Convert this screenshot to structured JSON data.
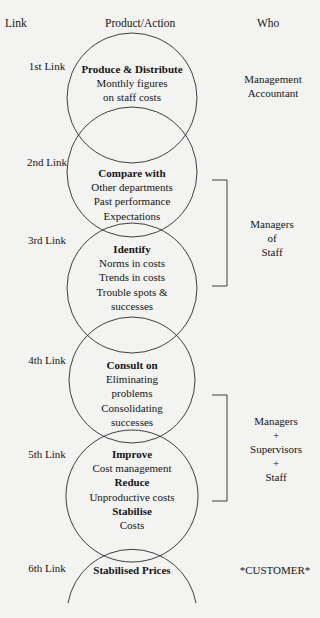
{
  "headers": {
    "link": "Link",
    "product_action": "Product/Action",
    "who": "Who"
  },
  "links": [
    {
      "label": "1st Link",
      "lines": [
        {
          "text": "Produce & Distribute",
          "bold": true
        },
        {
          "text": "Monthly figures"
        },
        {
          "text": "on staff costs"
        }
      ]
    },
    {
      "label": "2nd Link",
      "lines": [
        {
          "text": "Compare with",
          "bold": true
        },
        {
          "text": "Other departments"
        },
        {
          "text": "Past performance"
        },
        {
          "text": "Expectations"
        }
      ]
    },
    {
      "label": "3rd Link",
      "lines": [
        {
          "text": "Identify",
          "bold": true
        },
        {
          "text": "Norms in costs"
        },
        {
          "text": "Trends in costs"
        },
        {
          "text": "Trouble spots &"
        },
        {
          "text": "successes"
        }
      ]
    },
    {
      "label": "4th Link",
      "lines": [
        {
          "text": "Consult on",
          "bold": true
        },
        {
          "text": "Eliminating"
        },
        {
          "text": "problems"
        },
        {
          "text": "Consolidating"
        },
        {
          "text": "successes"
        }
      ]
    },
    {
      "label": "5th Link",
      "lines": [
        {
          "text": "Improve",
          "bold": true
        },
        {
          "text": "Cost management"
        },
        {
          "text": "Reduce",
          "bold": true
        },
        {
          "text": "Unproductive costs"
        },
        {
          "text": "Stabilise",
          "bold": true
        },
        {
          "text": "Costs"
        }
      ]
    },
    {
      "label": "6th Link",
      "lines": [
        {
          "text": "Stabilised Prices",
          "bold": true
        }
      ]
    }
  ],
  "who": {
    "management_accountant": [
      "Management",
      "Accountant"
    ],
    "managers_of_staff": [
      "Managers",
      "of",
      "Staff"
    ],
    "managers_supervisors_staff": [
      "Managers",
      "+",
      "Supervisors",
      "+",
      "Staff"
    ],
    "customer": "*CUSTOMER*"
  },
  "colors": {
    "background": "#f3f3f1",
    "ink": "#151515",
    "stroke": "#2a2a2a"
  }
}
